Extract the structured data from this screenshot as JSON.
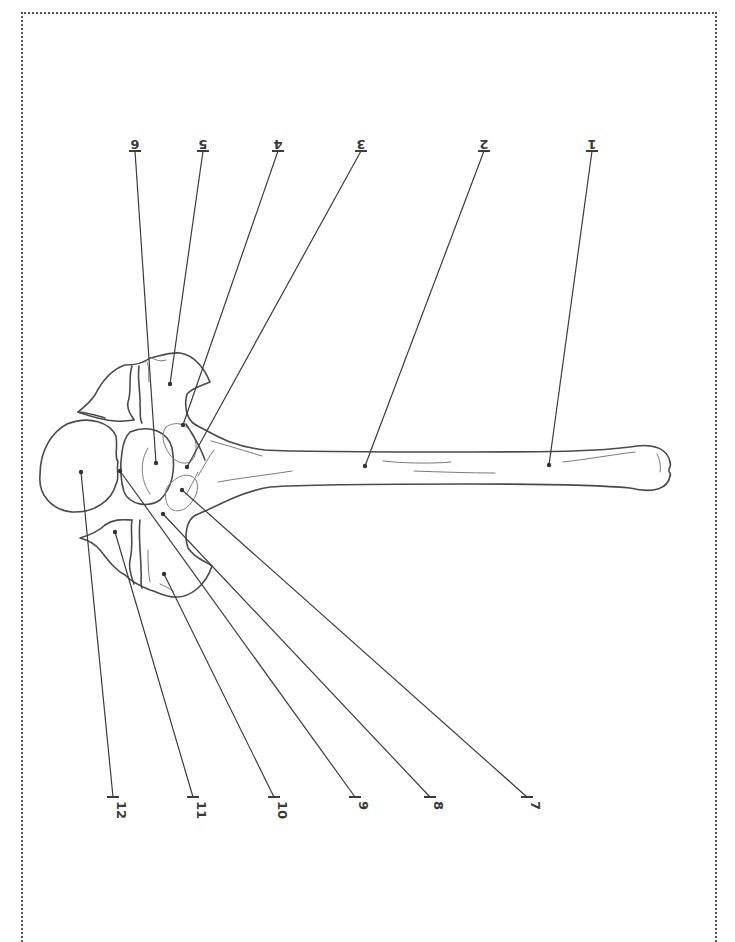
{
  "diagram": {
    "orientation_note": "labels rendered upside down",
    "label_count": 12,
    "top_labels": [
      {
        "num": "1",
        "x": 592,
        "dot": [
          549,
          465
        ]
      },
      {
        "num": "2",
        "x": 484,
        "dot": [
          365,
          466
        ]
      },
      {
        "num": "3",
        "x": 361,
        "dot": [
          187,
          467
        ]
      },
      {
        "num": "4",
        "x": 278,
        "dot": [
          183,
          425
        ]
      },
      {
        "num": "5",
        "x": 203,
        "dot": [
          170,
          384
        ]
      },
      {
        "num": "6",
        "x": 135,
        "dot": [
          156,
          463
        ]
      }
    ],
    "bottom_labels": [
      {
        "num": "7",
        "x": 527,
        "dot": [
          182,
          490
        ]
      },
      {
        "num": "8",
        "x": 430,
        "dot": [
          163,
          514
        ]
      },
      {
        "num": "9",
        "x": 355,
        "dot": [
          120,
          471
        ]
      },
      {
        "num": "10",
        "x": 274,
        "dot": [
          164,
          574
        ]
      },
      {
        "num": "11",
        "x": 193,
        "dot": [
          115,
          532
        ]
      },
      {
        "num": "12",
        "x": 113,
        "dot": [
          81,
          472
        ]
      }
    ],
    "colors": {
      "line": "#3c3c3c",
      "outline": "#4a4a4a",
      "border": "#555555",
      "background": "#ffffff"
    }
  }
}
